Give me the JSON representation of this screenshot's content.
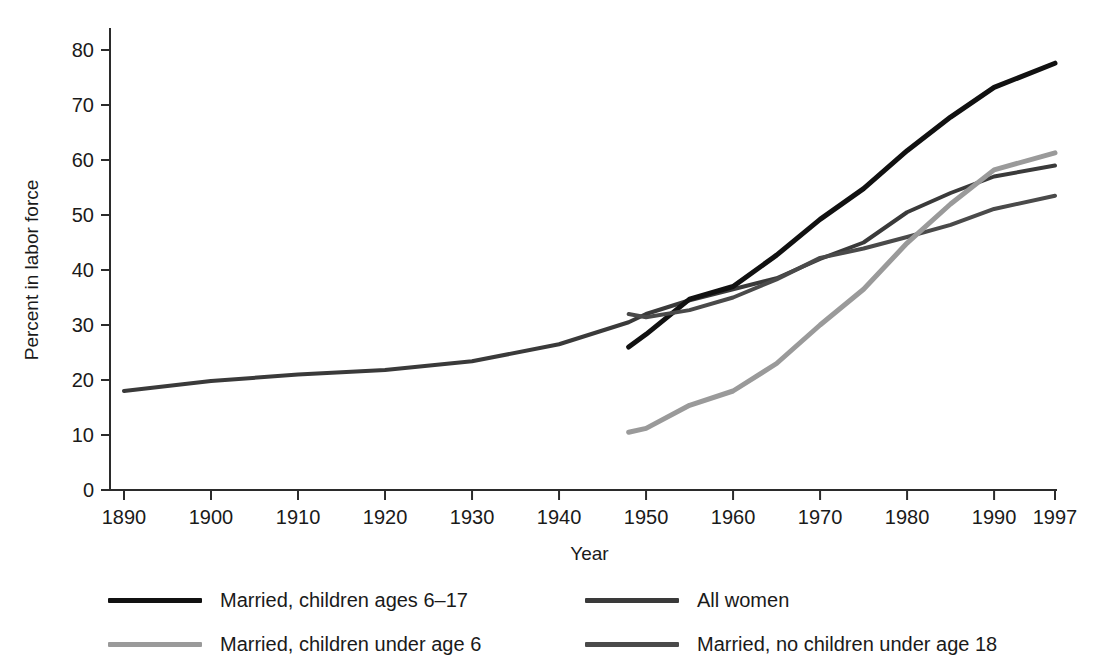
{
  "chart_data": {
    "type": "line",
    "title": "",
    "xlabel": "Year",
    "ylabel": "Percent in labor force",
    "xlim": [
      1890,
      1997
    ],
    "ylim": [
      0,
      80
    ],
    "grid": false,
    "legend_position": "below-plot-two-columns",
    "x_ticks": [
      "1890",
      "1900",
      "1910",
      "1920",
      "1930",
      "1940",
      "1950",
      "1960",
      "1970",
      "1980",
      "1990",
      "1997"
    ],
    "x_tick_values": [
      1890,
      1900,
      1910,
      1920,
      1930,
      1940,
      1950,
      1960,
      1970,
      1980,
      1990,
      1997
    ],
    "y_ticks": [
      "0",
      "10",
      "20",
      "30",
      "40",
      "50",
      "60",
      "70",
      "80"
    ],
    "y_tick_values": [
      0,
      10,
      20,
      30,
      40,
      50,
      60,
      70,
      80
    ],
    "series": [
      {
        "name": "All women",
        "color": "#3a3a3a",
        "width": 4,
        "x": [
          1890,
          1900,
          1910,
          1920,
          1930,
          1940,
          1948,
          1950,
          1955,
          1960,
          1965,
          1970,
          1975,
          1980,
          1985,
          1990,
          1997
        ],
        "values": [
          18.0,
          19.8,
          21.0,
          21.8,
          23.4,
          26.5,
          30.5,
          32.0,
          34.5,
          36.5,
          38.5,
          42.0,
          45.0,
          50.5,
          54.0,
          57.0,
          59.0
        ]
      },
      {
        "name": "Married, children ages 6–17",
        "color": "#111111",
        "width": 5,
        "x": [
          1948,
          1950,
          1955,
          1960,
          1965,
          1970,
          1975,
          1980,
          1985,
          1990,
          1997
        ],
        "values": [
          26.0,
          28.3,
          34.7,
          37.0,
          42.7,
          49.2,
          54.8,
          61.7,
          67.8,
          73.2,
          77.6
        ]
      },
      {
        "name": "Married, no children under age 18",
        "color": "#4a4a4a",
        "width": 4,
        "x": [
          1948,
          1950,
          1955,
          1960,
          1965,
          1970,
          1975,
          1980,
          1985,
          1990,
          1997
        ],
        "values": [
          32.0,
          31.4,
          32.7,
          35.0,
          38.3,
          42.2,
          43.9,
          46.0,
          48.2,
          51.1,
          53.5
        ]
      },
      {
        "name": "Married, children under age 6",
        "color": "#9a9a9a",
        "width": 5,
        "x": [
          1948,
          1950,
          1955,
          1960,
          1965,
          1970,
          1975,
          1980,
          1985,
          1990,
          1997
        ],
        "values": [
          10.5,
          11.2,
          15.4,
          18.0,
          23.0,
          30.0,
          36.5,
          44.9,
          52.0,
          58.2,
          61.3
        ]
      }
    ],
    "legend": [
      {
        "label": "Married, children ages 6–17",
        "color": "#111111",
        "column": "left"
      },
      {
        "label": "All women",
        "color": "#3a3a3a",
        "column": "right"
      },
      {
        "label": "Married, children under age 6",
        "color": "#9a9a9a",
        "column": "left"
      },
      {
        "label": "Married, no children under age 18",
        "color": "#4a4a4a",
        "column": "right"
      }
    ]
  }
}
